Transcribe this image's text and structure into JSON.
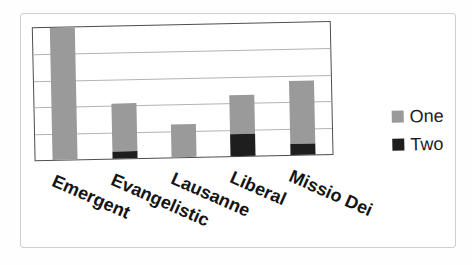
{
  "chart_data": {
    "type": "bar",
    "stacked": true,
    "title": "",
    "xlabel": "",
    "ylabel": "",
    "categories": [
      "Emergent",
      "Evangelistic",
      "Lausanne",
      "Liberal",
      "Missio Dei"
    ],
    "series": [
      {
        "name": "One",
        "color": "#9a9a9a",
        "values": [
          5.0,
          1.85,
          1.25,
          1.45,
          2.4
        ]
      },
      {
        "name": "Two",
        "color": "#1e1e1e",
        "values": [
          0,
          0.25,
          0,
          0.85,
          0.4
        ]
      }
    ],
    "ylim": [
      0,
      5
    ],
    "gridline_step": 1,
    "grid": "horizontal",
    "y_tick_labels_visible": false,
    "legend_position": "right",
    "legend_entries": [
      "One",
      "Two"
    ],
    "x_label_rotation_deg": 25
  },
  "colors": {
    "plot_border": "#4d4d4d",
    "gridline": "#b3b3b3",
    "card_frame_border": "#cfcfcf",
    "label_text": "#141414",
    "background": "#ffffff"
  }
}
